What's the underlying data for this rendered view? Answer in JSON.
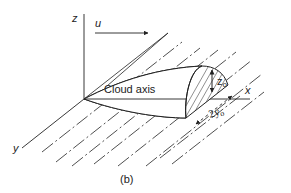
{
  "figure": {
    "caption": "(b)",
    "labels": {
      "z_axis": "z",
      "y_axis": "y",
      "x_axis": "x",
      "wind": "u",
      "cloud_axis": "Cloud axis",
      "height": "z",
      "height_sub": "o",
      "width": "2y",
      "width_sub": "o"
    },
    "colors": {
      "line": "#222222",
      "background": "#ffffff"
    }
  }
}
